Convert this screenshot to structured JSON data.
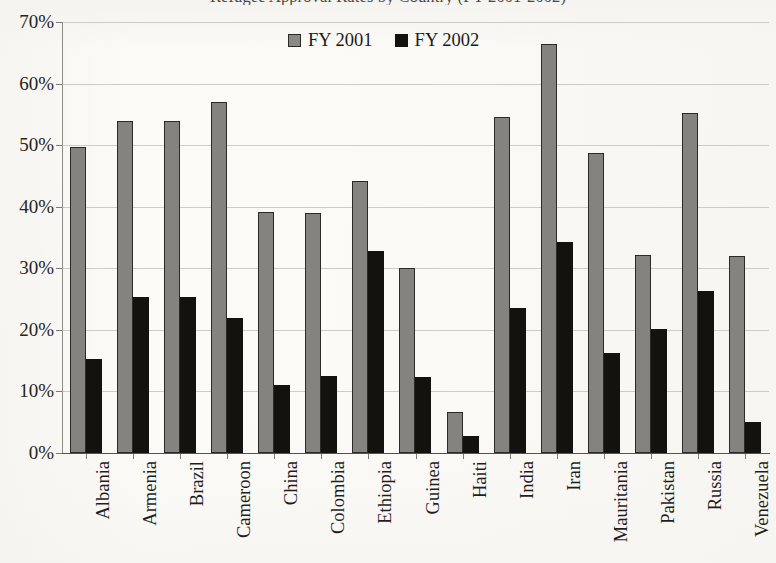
{
  "chart_data": {
    "type": "bar",
    "title": "Refugee Approval Rates by Country (FY 2001-2002)",
    "xlabel": "",
    "ylabel": "",
    "ylim": [
      0,
      70
    ],
    "ytick_labels": [
      "0%",
      "10%",
      "20%",
      "30%",
      "40%",
      "50%",
      "60%",
      "70%"
    ],
    "ytick_values": [
      0,
      10,
      20,
      30,
      40,
      50,
      60,
      70
    ],
    "grid": true,
    "legend_position": "top-center",
    "categories": [
      "Albania",
      "Armenia",
      "Brazil",
      "Cameroon",
      "China",
      "Colombia",
      "Ethiopia",
      "Guinea",
      "Haiti",
      "India",
      "Iran",
      "Mauritania",
      "Pakistan",
      "Russia",
      "Venezuela"
    ],
    "series": [
      {
        "name": "FY 2001",
        "color": "#848380",
        "values": [
          49.7,
          54.0,
          54.0,
          57.0,
          39.2,
          39.0,
          44.2,
          30.0,
          6.7,
          54.5,
          66.5,
          48.8,
          32.2,
          55.2,
          32.0
        ]
      },
      {
        "name": "FY 2002",
        "color": "#14120f",
        "values": [
          15.3,
          25.3,
          25.3,
          22.0,
          11.0,
          12.5,
          32.8,
          12.3,
          2.7,
          23.5,
          34.3,
          16.2,
          20.2,
          26.3,
          5.0
        ]
      }
    ]
  }
}
